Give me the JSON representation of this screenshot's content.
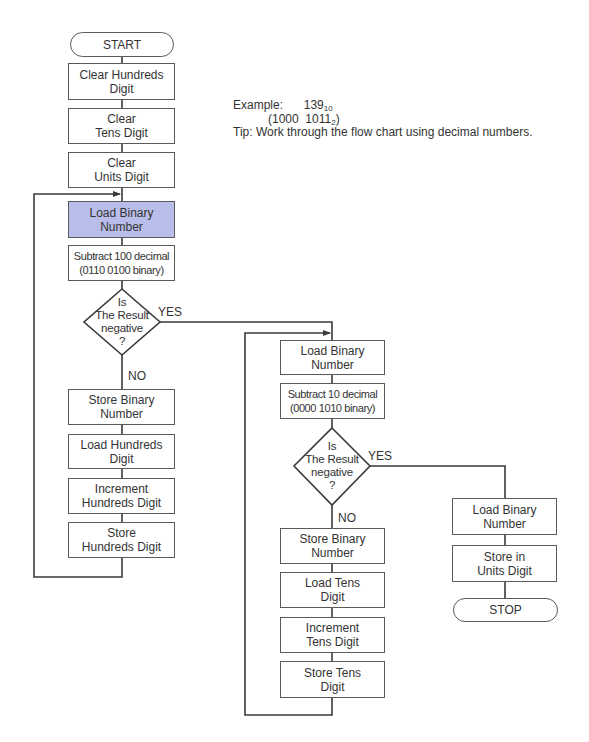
{
  "note": {
    "example_label": "Example:",
    "example_decimal": "139",
    "example_decimal_base": "10",
    "example_binary_open": "(1000  1011",
    "example_binary_base": "2",
    "example_binary_close": ")",
    "tip": "Tip: Work through the flow chart using decimal numbers."
  },
  "colors": {
    "highlight": "#b9bde9",
    "line": "#3a3a3a",
    "box_border": "#5a5a5a"
  },
  "flowchart": {
    "start": "START",
    "stop": "STOP",
    "column1": {
      "clear_hundreds": "Clear Hundreds\nDigit",
      "clear_tens": "Clear\nTens Digit",
      "clear_units": "Clear\nUnits Digit",
      "load_binary": "Load Binary\nNumber",
      "subtract": "Subtract 100 decimal\n(0110 0100 binary)",
      "decision": "Is\nThe Result\nnegative\n?",
      "yes": "YES",
      "no": "NO",
      "store_binary": "Store Binary\nNumber",
      "load_hundreds": "Load Hundreds\nDigit",
      "increment_hundreds": "Increment\nHundreds Digit",
      "store_hundreds": "Store\nHundreds Digit"
    },
    "column2": {
      "load_binary": "Load Binary\nNumber",
      "subtract": "Subtract 10 decimal\n(0000 1010 binary)",
      "decision": "Is\nThe Result\nnegative\n?",
      "yes": "YES",
      "no": "NO",
      "store_binary": "Store Binary\nNumber",
      "load_tens": "Load Tens\nDigit",
      "increment_tens": "Increment\nTens Digit",
      "store_tens": "Store Tens\nDigit"
    },
    "column3": {
      "load_binary": "Load Binary\nNumber",
      "store_units": "Store in\nUnits Digit"
    }
  }
}
